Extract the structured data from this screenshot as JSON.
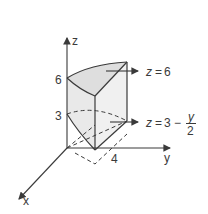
{
  "diagram": {
    "type": "3d-solid-region",
    "axes": {
      "x": "x",
      "y": "y",
      "z": "z"
    },
    "ticks": {
      "z_top": "6",
      "z_mid": "3",
      "y_tick": "4"
    },
    "annotations": {
      "top_surface": {
        "lhs": "z",
        "eq": "=",
        "rhs": "6"
      },
      "bottom_surface": {
        "lhs": "z",
        "eq": "=",
        "rhs": "3 −",
        "frac_num": "y",
        "frac_den": "2"
      }
    },
    "colors": {
      "stroke": "#3a3a3a",
      "fill": "#e6e6e6",
      "background": "#ffffff"
    }
  }
}
